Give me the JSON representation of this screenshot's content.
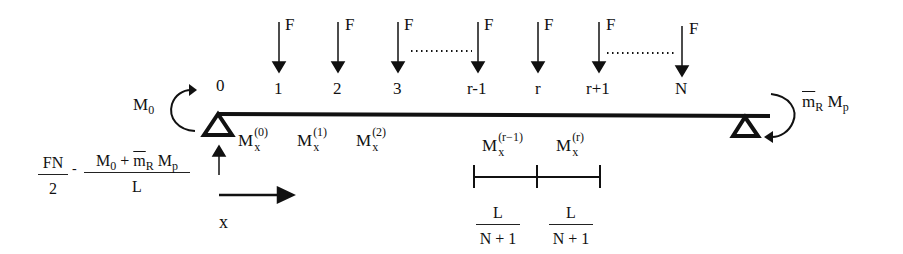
{
  "diagram": {
    "type": "beam-free-body-diagram",
    "beam": {
      "left_support": "pin (triangle)",
      "right_support": "pin (triangle)"
    },
    "loads": {
      "force_label": "F",
      "node_labels": [
        "0",
        "1",
        "2",
        "3",
        "r-1",
        "r",
        "r+1",
        "N"
      ],
      "forces_at_nodes": [
        "1",
        "2",
        "3",
        "r-1",
        "r",
        "r+1",
        "N"
      ]
    },
    "left_moment": {
      "symbol": "M",
      "subscript": "0"
    },
    "right_moment": {
      "m": "m",
      "m_sub": "R",
      "M": "M",
      "M_sub": "p"
    },
    "reaction": {
      "term1_num": "FN",
      "term1_den": "2",
      "minus": "-",
      "term2_num_M": "M",
      "term2_num_Msub": "0",
      "term2_num_plus": "+",
      "term2_num_m": "m",
      "term2_num_msub": "R",
      "term2_num_M2": "M",
      "term2_num_M2sub": "p",
      "term2_den": "L"
    },
    "x_axis_label": "x",
    "section_moments": [
      {
        "M": "M",
        "sub": "x",
        "sup": "(0)"
      },
      {
        "M": "M",
        "sub": "x",
        "sup": "(1)"
      },
      {
        "M": "M",
        "sub": "x",
        "sup": "(2)"
      },
      {
        "M": "M",
        "sub": "x",
        "sup": "(r−1)"
      },
      {
        "M": "M",
        "sub": "x",
        "sup": "(r)"
      }
    ],
    "segment_length": {
      "num": "L",
      "den": "N + 1"
    }
  }
}
